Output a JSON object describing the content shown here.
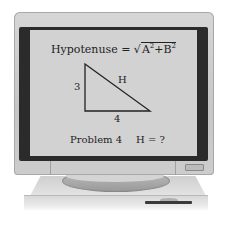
{
  "screen": {
    "formula_lhs": "Hypotenuse = ",
    "formula_sqrt": "√",
    "formula_a": "A",
    "formula_a_exp": "2",
    "formula_plus": "+B",
    "formula_b_exp": "2",
    "triangle": {
      "side_vertical_label": "3",
      "side_horizontal_label": "4",
      "hypotenuse_label": "H"
    },
    "problem_label": "Problem 4",
    "question": "H = ?"
  },
  "colors": {
    "monitor_bezel": "#c8c8c8",
    "screen_border": "#2b2b2b",
    "screen_bg": "#d2d2d2",
    "text": "#222222"
  }
}
